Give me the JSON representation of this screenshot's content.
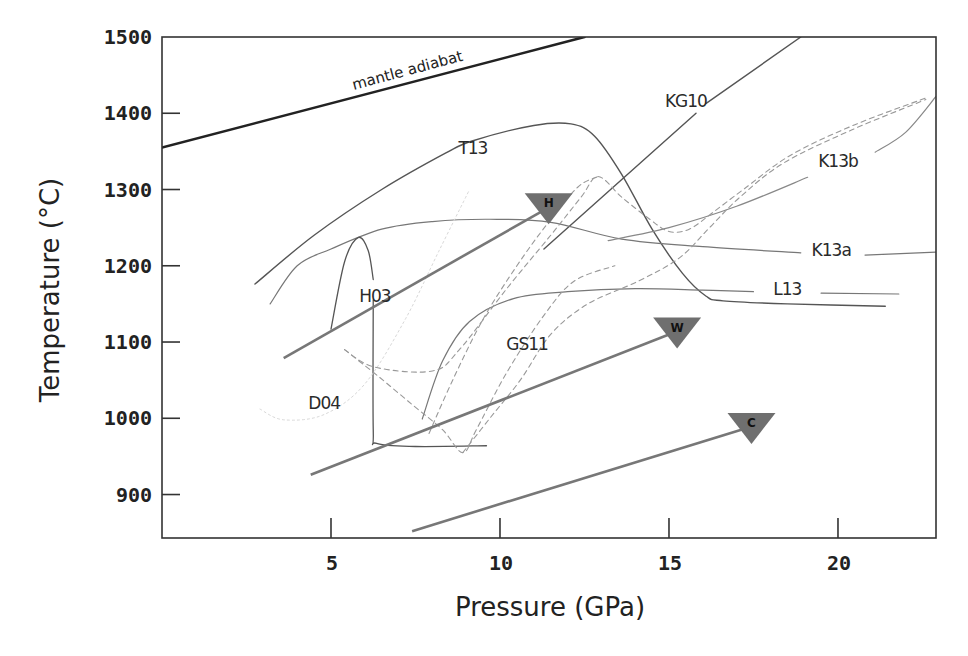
{
  "chart_data": {
    "type": "line",
    "title": "",
    "xlabel": "Pressure (GPa)",
    "ylabel": "Temperature (°C)",
    "xlim": [
      0,
      22.9
    ],
    "ylim": [
      843,
      1500
    ],
    "grid": false,
    "legend": "none (curves labelled inline)",
    "x_ticks": [
      5,
      10,
      15,
      20
    ],
    "y_ticks": [
      900,
      1000,
      1100,
      1200,
      1300,
      1400,
      1500
    ],
    "series": [
      {
        "name": "mantle adiabat",
        "style": "solid-thick",
        "color": "#222222",
        "width": 2.6,
        "points": [
          [
            0,
            1355
          ],
          [
            12.5,
            1500
          ]
        ],
        "label": {
          "text": "mantle adiabat",
          "at": [
            7.3,
            1450
          ],
          "rotate": -15
        }
      },
      {
        "name": "T13",
        "style": "solid",
        "color": "#555555",
        "width": 1.4,
        "points": [
          [
            2.75,
            1176
          ],
          [
            4.5,
            1240
          ],
          [
            6.5,
            1300
          ],
          [
            8.4,
            1348
          ],
          [
            9.2,
            1364
          ],
          [
            11,
            1384
          ],
          [
            12.1,
            1386
          ],
          [
            12.8,
            1370
          ],
          [
            13.6,
            1320
          ],
          [
            14.5,
            1248
          ],
          [
            15.4,
            1190
          ],
          [
            16.1,
            1160
          ],
          [
            16.6,
            1154
          ],
          [
            18.5,
            1150
          ],
          [
            21.4,
            1147
          ]
        ],
        "label": {
          "text": "T13",
          "at": [
            9.2,
            1346
          ]
        }
      },
      {
        "name": "KG10",
        "style": "solid",
        "color": "#555555",
        "width": 1.4,
        "points": [
          [
            11.3,
            1222
          ],
          [
            15.8,
            1400
          ]
        ],
        "points2": [
          [
            16.1,
            1413
          ],
          [
            18.9,
            1500
          ]
        ],
        "label": {
          "text": "KG10",
          "at": [
            15.5,
            1408
          ]
        }
      },
      {
        "name": "K13a",
        "style": "solid",
        "color": "#777777",
        "width": 1.2,
        "points": [
          [
            3.2,
            1150
          ],
          [
            4,
            1200
          ],
          [
            5,
            1222
          ],
          [
            6.5,
            1248
          ],
          [
            8,
            1258
          ],
          [
            9.7,
            1261
          ],
          [
            11.5,
            1257
          ],
          [
            13.6,
            1235
          ],
          [
            16,
            1225
          ],
          [
            18.9,
            1217
          ]
        ],
        "points2": [
          [
            20.8,
            1214
          ],
          [
            22.9,
            1218
          ]
        ],
        "label": {
          "text": "K13a",
          "at": [
            19.8,
            1213
          ]
        }
      },
      {
        "name": "K13b",
        "style": "solid",
        "color": "#888888",
        "width": 1.2,
        "points": [
          [
            13.2,
            1233
          ],
          [
            15,
            1250
          ],
          [
            17,
            1278
          ],
          [
            19.1,
            1316
          ]
        ],
        "points2": [
          [
            21.1,
            1349
          ],
          [
            22.0,
            1375
          ],
          [
            22.9,
            1422
          ]
        ],
        "label": {
          "text": "K13b",
          "at": [
            20.0,
            1330
          ]
        }
      },
      {
        "name": "L13",
        "style": "solid",
        "color": "#777777",
        "width": 1.2,
        "points": [
          [
            7.7,
            999
          ],
          [
            8.3,
            1075
          ],
          [
            9.1,
            1127
          ],
          [
            10.4,
            1157
          ],
          [
            12,
            1166
          ],
          [
            14,
            1170
          ],
          [
            16,
            1168
          ],
          [
            17.5,
            1166
          ]
        ],
        "points2": [
          [
            19.5,
            1164
          ],
          [
            21.8,
            1163
          ]
        ],
        "label": {
          "text": "L13",
          "at": [
            18.5,
            1162
          ]
        }
      },
      {
        "name": "H03",
        "style": "solid",
        "color": "#555555",
        "width": 1.3,
        "points": [
          [
            5.0,
            1117
          ],
          [
            5.4,
            1205
          ],
          [
            5.8,
            1237
          ],
          [
            6.1,
            1220
          ],
          [
            6.25,
            1182
          ]
        ],
        "points2": [
          [
            6.25,
            1155
          ],
          [
            6.25,
            985
          ],
          [
            6.35,
            967
          ],
          [
            7.5,
            963
          ],
          [
            9.6,
            964
          ]
        ],
        "label": {
          "text": "H03",
          "at": [
            6.3,
            1152
          ]
        }
      },
      {
        "name": "D04",
        "style": "dotted-faint",
        "color": "#d8d8d8",
        "width": 1.0,
        "points": [
          [
            2.9,
            1012
          ],
          [
            3.6,
            998
          ],
          [
            4.8,
            1005
          ],
          [
            6.0,
            1045
          ],
          [
            7.2,
            1130
          ],
          [
            8.2,
            1220
          ],
          [
            9.1,
            1300
          ]
        ],
        "label": {
          "text": "D04",
          "at": [
            4.8,
            1012
          ]
        }
      },
      {
        "name": "GS11",
        "style": "dashed",
        "color": "#999999",
        "width": 1.1,
        "points": [
          [
            5.4,
            1090
          ],
          [
            6.3,
            1067
          ],
          [
            8.0,
            1062
          ],
          [
            8.8,
            1090
          ],
          [
            10.2,
            1170
          ],
          [
            11.5,
            1240
          ],
          [
            12.4,
            1290
          ],
          [
            12.9,
            1317
          ],
          [
            13.6,
            1290
          ],
          [
            14.4,
            1262
          ],
          [
            15.0,
            1245
          ],
          [
            15.6,
            1248
          ],
          [
            16.3,
            1270
          ],
          [
            17.2,
            1300
          ],
          [
            18.6,
            1345
          ],
          [
            20.5,
            1385
          ],
          [
            22.6,
            1420
          ]
        ],
        "label": {
          "text": "GS11",
          "at": [
            10.8,
            1090
          ]
        }
      },
      {
        "name": "GS11-b",
        "style": "dashed",
        "color": "#999999",
        "width": 1.1,
        "points": [
          [
            5.4,
            1090
          ],
          [
            6.4,
            1055
          ],
          [
            7.4,
            1018
          ],
          [
            8.3,
            985
          ],
          [
            8.9,
            955
          ],
          [
            9.3,
            985
          ],
          [
            10.2,
            1060
          ],
          [
            11.3,
            1135
          ],
          [
            12.2,
            1180
          ],
          [
            13.4,
            1200
          ]
        ],
        "label": null
      },
      {
        "name": "GS11-c",
        "style": "dashed",
        "color": "#999999",
        "width": 1.1,
        "points": [
          [
            8.9,
            955
          ],
          [
            9.7,
            1000
          ],
          [
            10.6,
            1050
          ],
          [
            11.5,
            1110
          ],
          [
            12.6,
            1150
          ],
          [
            14.1,
            1180
          ],
          [
            15.3,
            1210
          ],
          [
            16.2,
            1250
          ],
          [
            17.1,
            1290
          ],
          [
            18.4,
            1335
          ],
          [
            20.4,
            1378
          ],
          [
            22.6,
            1418
          ]
        ],
        "label": null
      },
      {
        "name": "GS11-d",
        "style": "dashed",
        "color": "#999999",
        "width": 1.1,
        "points": [
          [
            7.9,
            980
          ],
          [
            8.6,
            1050
          ],
          [
            9.5,
            1130
          ],
          [
            10.5,
            1200
          ],
          [
            11.4,
            1255
          ],
          [
            12.3,
            1303
          ],
          [
            12.9,
            1317
          ]
        ],
        "label": null
      }
    ],
    "arrows": [
      {
        "name": "H",
        "label": "H",
        "from": [
          3.6,
          1079
        ],
        "to": [
          11.5,
          1278
        ],
        "color": "#777777"
      },
      {
        "name": "W",
        "label": "W",
        "from": [
          4.4,
          926
        ],
        "to": [
          15.3,
          1115
        ],
        "color": "#777777"
      },
      {
        "name": "C",
        "label": "C",
        "from": [
          7.4,
          852
        ],
        "to": [
          17.5,
          990
        ],
        "color": "#777777"
      }
    ]
  }
}
